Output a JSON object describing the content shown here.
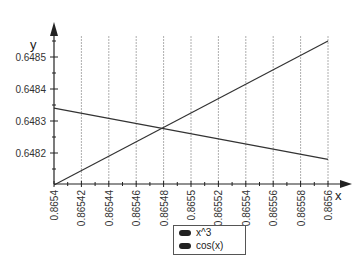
{
  "chart_data": {
    "type": "line",
    "title": "",
    "xlabel": "x",
    "ylabel": "y",
    "xlim": [
      0.8654,
      0.8656
    ],
    "ylim": [
      0.6481,
      0.64858
    ],
    "x_ticks": [
      "0.8654",
      "0.86542",
      "0.86544",
      "0.86546",
      "0.86548",
      "0.8655",
      "0.86552",
      "0.86554",
      "0.86556",
      "0.86558",
      "0.8656"
    ],
    "y_ticks": [
      "0.6482",
      "0.6483",
      "0.6484",
      "0.6485"
    ],
    "grid": "vertical dashed at x ticks",
    "legend_position": "bottom center",
    "series": [
      {
        "name": "x^3",
        "x": [
          0.8654,
          0.8656
        ],
        "values": [
          0.6481,
          0.64855
        ]
      },
      {
        "name": "cos(x)",
        "x": [
          0.8654,
          0.8656
        ],
        "values": [
          0.64834,
          0.64818
        ]
      }
    ]
  },
  "legend": {
    "items": [
      "x^3",
      "cos(x)"
    ]
  },
  "colors": {
    "line": "#333333",
    "grid": "#999999"
  }
}
